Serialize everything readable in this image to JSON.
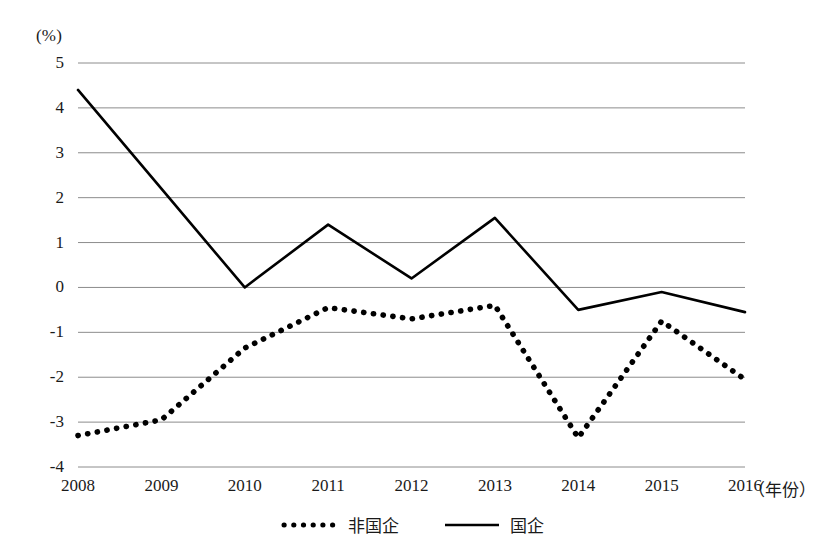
{
  "chart_data": {
    "type": "line",
    "title": "",
    "subtitle": "",
    "xlabel": "（年份）",
    "ylabel": "(%)",
    "categories": [
      "2008",
      "2009",
      "2010",
      "2011",
      "2012",
      "2013",
      "2014",
      "2015",
      "2016"
    ],
    "x": [
      2008,
      2009,
      2010,
      2011,
      2012,
      2013,
      2014,
      2015,
      2016
    ],
    "xlim": [
      2008,
      2016
    ],
    "ylim": [
      -4,
      5
    ],
    "yticks": [
      "5",
      "4",
      "3",
      "2",
      "1",
      "0",
      "-1",
      "-2",
      "-3",
      "-4"
    ],
    "ytick_values": [
      5,
      4,
      3,
      2,
      1,
      0,
      -1,
      -2,
      -3,
      -4
    ],
    "grid": "horizontal",
    "legend_position": "bottom-center",
    "series": [
      {
        "name": "非国企",
        "style": "dotted",
        "color": "#000000",
        "values": [
          -3.3,
          -2.95,
          -1.35,
          -0.45,
          -0.7,
          -0.4,
          -3.35,
          -0.75,
          -2.05
        ]
      },
      {
        "name": "国企",
        "style": "solid",
        "color": "#000000",
        "values": [
          4.4,
          2.2,
          0.0,
          1.4,
          0.2,
          1.55,
          -0.5,
          -0.1,
          -0.55
        ]
      }
    ]
  },
  "legend": {
    "items": [
      {
        "label": "非国企",
        "marker": "dotted-line-swatch"
      },
      {
        "label": "国企",
        "marker": "solid-line-swatch"
      }
    ]
  }
}
